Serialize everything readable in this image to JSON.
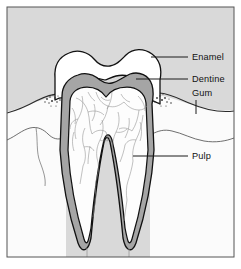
{
  "figure": {
    "frame_border_color": "#555555",
    "background_color": "#d9d9d9",
    "gum_color": "#fbfbfb",
    "enamel_color": "#ffffff",
    "dentine_color": "#a5a5a5",
    "pulp_color": "#fdfdfd",
    "outline_color": "#111111",
    "leader_color": "#1a1a1a"
  },
  "labels": [
    {
      "id": "enamel",
      "text": "Enamel",
      "x": 192,
      "y": 60,
      "leader": "M188,57 L151,57"
    },
    {
      "id": "dentine",
      "text": "Dentine",
      "x": 192,
      "y": 82,
      "leader": "M188,79 L136,79"
    },
    {
      "id": "gum",
      "text": "Gum",
      "x": 192,
      "y": 96,
      "leader": "M196,100 L196,114"
    },
    {
      "id": "pulp",
      "text": "Pulp",
      "x": 192,
      "y": 159,
      "leader": "M188,156 L133,156"
    }
  ],
  "structures": [
    {
      "id": "enamel",
      "name": "Enamel",
      "region": "outer crown layer",
      "color": "#ffffff"
    },
    {
      "id": "dentine",
      "name": "Dentine",
      "region": "middle tooth layer",
      "color": "#a5a5a5"
    },
    {
      "id": "gum",
      "name": "Gum",
      "region": "surrounding soft tissue",
      "color": "#fbfbfb"
    },
    {
      "id": "pulp",
      "name": "Pulp",
      "region": "inner chamber and root canals",
      "color": "#fdfdfd"
    }
  ]
}
